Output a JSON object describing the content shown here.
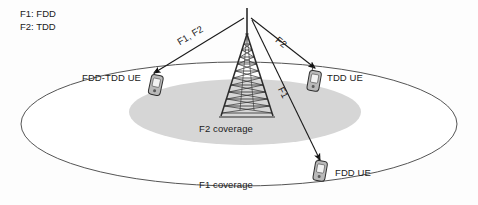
{
  "diagram": {
    "legend": {
      "line1": "F1: FDD",
      "line2": "F2: TDD"
    },
    "coverage": {
      "outer_label": "F1 coverage",
      "inner_label": "F2 coverage",
      "outer_fill": "#ffffff",
      "outer_stroke": "#555555",
      "inner_fill": "#d6d6d6"
    },
    "tower": {
      "name": "base-station-tower",
      "color": "#2b2b2b"
    },
    "devices": [
      {
        "id": "fdd-tdd-ue",
        "label": "FDD-TDD UE",
        "label_side": "left"
      },
      {
        "id": "tdd-ue",
        "label": "TDD UE",
        "label_side": "right"
      },
      {
        "id": "fdd-ue",
        "label": "FDD UE",
        "label_side": "right"
      }
    ],
    "links": [
      {
        "id": "link-f1-f2",
        "label": "F1, F2",
        "target": "fdd-tdd-ue"
      },
      {
        "id": "link-f2",
        "label": "F2",
        "target": "tdd-ue"
      },
      {
        "id": "link-f1",
        "label": "F1",
        "target": "fdd-ue"
      }
    ]
  }
}
